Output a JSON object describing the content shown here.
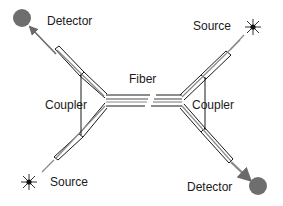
{
  "labels": {
    "detector_top_left": "Detector",
    "source_top_right": "Source",
    "fiber": "Fiber",
    "coupler_left": "Coupler",
    "coupler_right": "Coupler",
    "source_bottom_left": "Source",
    "detector_bottom_right": "Detector"
  },
  "components": [
    {
      "id": "detector-top-left",
      "type": "detector",
      "icon": "filled-circle-icon",
      "color": "#6e6e6e"
    },
    {
      "id": "source-top-right",
      "type": "source",
      "icon": "starburst-icon",
      "color": "#222222"
    },
    {
      "id": "coupler-left",
      "type": "coupler"
    },
    {
      "id": "fiber",
      "type": "fiber",
      "note": "broken line (long span)"
    },
    {
      "id": "coupler-right",
      "type": "coupler"
    },
    {
      "id": "source-bottom-left",
      "type": "source",
      "icon": "starburst-icon",
      "color": "#222222"
    },
    {
      "id": "detector-bottom-right",
      "type": "detector",
      "icon": "filled-circle-icon",
      "color": "#6e6e6e"
    }
  ],
  "colors": {
    "line": "#1a1a1a",
    "signal": "#8a8a8a",
    "detector": "#6e6e6e"
  }
}
